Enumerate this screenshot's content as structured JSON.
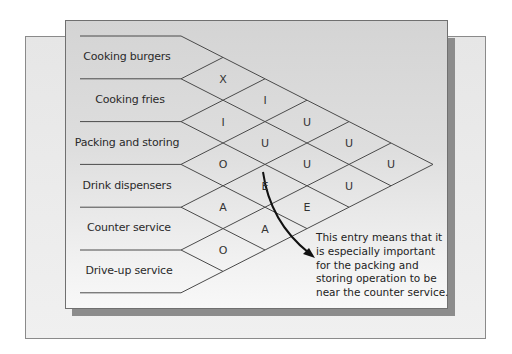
{
  "departments": [
    "Cooking burgers",
    "Cooking fries",
    "Packing and storing",
    "Drink dispensers",
    "Counter service",
    "Drive-up service"
  ],
  "relationships": [
    {
      "pair": [
        "Cooking burgers",
        "Cooking fries"
      ],
      "code": "X"
    },
    {
      "pair": [
        "Cooking burgers",
        "Packing and storing"
      ],
      "code": "I"
    },
    {
      "pair": [
        "Cooking burgers",
        "Drink dispensers"
      ],
      "code": "U"
    },
    {
      "pair": [
        "Cooking burgers",
        "Counter service"
      ],
      "code": "U"
    },
    {
      "pair": [
        "Cooking burgers",
        "Drive-up service"
      ],
      "code": "U"
    },
    {
      "pair": [
        "Cooking fries",
        "Packing and storing"
      ],
      "code": "I"
    },
    {
      "pair": [
        "Cooking fries",
        "Drink dispensers"
      ],
      "code": "U"
    },
    {
      "pair": [
        "Cooking fries",
        "Counter service"
      ],
      "code": "U"
    },
    {
      "pair": [
        "Cooking fries",
        "Drive-up service"
      ],
      "code": "U"
    },
    {
      "pair": [
        "Packing and storing",
        "Drink dispensers"
      ],
      "code": "O"
    },
    {
      "pair": [
        "Packing and storing",
        "Counter service"
      ],
      "code": "E"
    },
    {
      "pair": [
        "Packing and storing",
        "Drive-up service"
      ],
      "code": "E"
    },
    {
      "pair": [
        "Drink dispensers",
        "Counter service"
      ],
      "code": "A"
    },
    {
      "pair": [
        "Drink dispensers",
        "Drive-up service"
      ],
      "code": "A"
    },
    {
      "pair": [
        "Counter service",
        "Drive-up service"
      ],
      "code": "O"
    }
  ],
  "cells": [
    {
      "col": 1,
      "row": 1,
      "letter": "X"
    },
    {
      "col": 1,
      "row": 2,
      "letter": "I"
    },
    {
      "col": 1,
      "row": 3,
      "letter": "O"
    },
    {
      "col": 1,
      "row": 4,
      "letter": "A"
    },
    {
      "col": 1,
      "row": 5,
      "letter": "O"
    },
    {
      "col": 2,
      "row": 1,
      "letter": "I"
    },
    {
      "col": 2,
      "row": 2,
      "letter": "U"
    },
    {
      "col": 2,
      "row": 3,
      "letter": "E"
    },
    {
      "col": 2,
      "row": 4,
      "letter": "A"
    },
    {
      "col": 3,
      "row": 1,
      "letter": "U"
    },
    {
      "col": 3,
      "row": 2,
      "letter": "U"
    },
    {
      "col": 3,
      "row": 3,
      "letter": "E"
    },
    {
      "col": 4,
      "row": 1,
      "letter": "U"
    },
    {
      "col": 4,
      "row": 2,
      "letter": "U"
    },
    {
      "col": 5,
      "row": 1,
      "letter": "U"
    }
  ],
  "annotation": {
    "points_to": "E (Packing and storing – Counter service)",
    "lines": [
      "This entry means that it",
      "is especially important",
      "for the packing and",
      "storing operation to be",
      "near the counter service."
    ]
  }
}
